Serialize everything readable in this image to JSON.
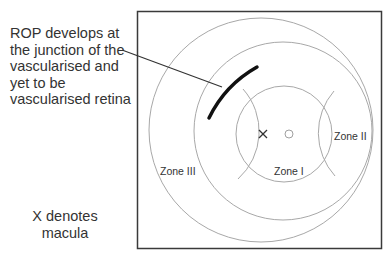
{
  "callout": {
    "text": "ROP develops at\nthe junction of the\nvascularised and\nyet to be\nvascularised retina"
  },
  "note": {
    "text": "X denotes\nmacula"
  },
  "diagram": {
    "macula_marker": "×",
    "zones": [
      {
        "id": "zone-1",
        "label": "Zone I"
      },
      {
        "id": "zone-2",
        "label": "Zone II"
      },
      {
        "id": "zone-3",
        "label": "Zone III"
      }
    ],
    "colors": {
      "frame": "#3a3a3a",
      "circles": "#a8a8a8",
      "lesion": "#111111",
      "leader": "#333333",
      "text": "#333333"
    }
  }
}
